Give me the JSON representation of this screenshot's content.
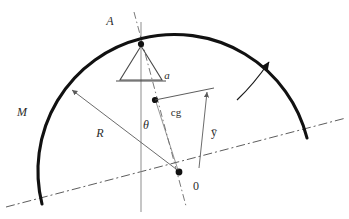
{
  "figure": {
    "background_color": "#ffffff",
    "stroke_color": "#1a1a1a",
    "thin_stroke_color": "#5a5a5a",
    "axis_color": "#6e6e6e",
    "width": 349,
    "height": 219
  },
  "labels": {
    "pivot": "A",
    "mass": "M",
    "radius": "R",
    "angle": "θ",
    "offset": "a",
    "center_of_gravity": "cg",
    "ybar": "ȳ",
    "origin": "0"
  },
  "geometry": {
    "arc_center": {
      "x": 179,
      "y": 172
    },
    "arc_radius": 128,
    "arc_start": {
      "x": 42,
      "y": 204
    },
    "arc_end": {
      "x": 307,
      "y": 138
    },
    "pivot_point": {
      "x": 141,
      "y": 44
    },
    "cg_point": {
      "x": 155,
      "y": 100
    },
    "origin_point": {
      "x": 179,
      "y": 172
    },
    "baseline_start": {
      "x": 6,
      "y": 207
    },
    "baseline_end": {
      "x": 346,
      "y": 118
    },
    "vertical_line_x": 141,
    "tilt_degrees": -14.7
  },
  "elements": {
    "arc_name": "semicircular-arc",
    "support_name": "triangular-support",
    "rotation_arrow_name": "rotation-arrow",
    "radius_arrow_name": "radius-arrow",
    "ybar_arrow_name": "ybar-arrow",
    "axis_name": "tilt-axis-dashdot",
    "baseline_name": "ground-baseline-dashdot",
    "vertical_name": "vertical-reference-line"
  }
}
